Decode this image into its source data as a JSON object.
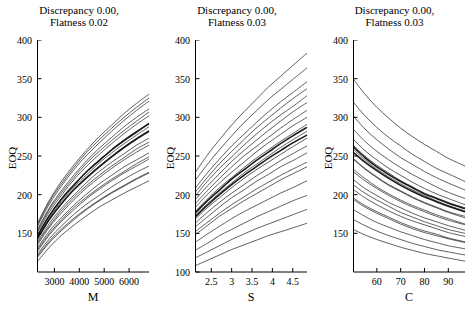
{
  "chart_data": [
    {
      "type": "line",
      "title": "Discrepancy 0.00, Flatness 0.02",
      "title_lines": [
        "Discrepancy 0.00,",
        "Flatness 0.02"
      ],
      "xlabel": "M",
      "ylabel": "EOQ",
      "xlim": [
        2300,
        6800
      ],
      "ylim": [
        100,
        400
      ],
      "xticks": [
        3000,
        4000,
        5000,
        6000
      ],
      "yticks": [
        150,
        200,
        250,
        300,
        350,
        400
      ],
      "grid": false,
      "legend": "none",
      "x": [
        2300,
        2800,
        3300,
        3800,
        4300,
        4800,
        5300,
        5800,
        6300,
        6800
      ],
      "series": [
        {
          "name": "curve-01",
          "values": [
            113,
            132,
            148,
            161,
            173,
            184,
            193,
            202,
            210,
            218
          ]
        },
        {
          "name": "curve-02",
          "values": [
            118,
            138,
            154,
            168,
            181,
            192,
            202,
            211,
            220,
            228
          ]
        },
        {
          "name": "curve-03",
          "values": [
            122,
            143,
            160,
            175,
            188,
            199,
            210,
            220,
            229,
            237
          ]
        },
        {
          "name": "curve-04",
          "values": [
            126,
            148,
            166,
            181,
            195,
            207,
            218,
            228,
            237,
            246
          ]
        },
        {
          "name": "curve-05",
          "values": [
            130,
            153,
            171,
            187,
            201,
            214,
            225,
            236,
            245,
            254
          ]
        },
        {
          "name": "curve-06",
          "values": [
            134,
            158,
            177,
            194,
            209,
            222,
            234,
            245,
            255,
            264
          ]
        },
        {
          "name": "curve-07",
          "values": [
            138,
            163,
            183,
            200,
            216,
            230,
            242,
            253,
            264,
            273
          ]
        },
        {
          "name": "curve-08",
          "values": [
            142,
            168,
            189,
            207,
            223,
            237,
            250,
            262,
            273,
            283
          ]
        },
        {
          "name": "curve-09",
          "values": [
            146,
            173,
            195,
            213,
            230,
            245,
            258,
            271,
            282,
            292
          ]
        },
        {
          "name": "curve-10",
          "values": [
            150,
            178,
            200,
            220,
            237,
            252,
            266,
            279,
            291,
            302
          ]
        },
        {
          "name": "curve-11",
          "values": [
            154,
            183,
            206,
            226,
            244,
            260,
            274,
            288,
            300,
            311
          ]
        },
        {
          "name": "curve-12",
          "values": [
            158,
            188,
            212,
            233,
            251,
            267,
            282,
            296,
            309,
            321
          ]
        },
        {
          "name": "curve-13",
          "values": [
            162,
            193,
            218,
            239,
            258,
            275,
            290,
            305,
            318,
            330
          ]
        },
        {
          "name": "curve-14",
          "values": [
            120,
            140,
            156,
            170,
            182,
            193,
            203,
            212,
            221,
            229
          ]
        },
        {
          "name": "curve-15",
          "values": [
            128,
            150,
            168,
            184,
            197,
            209,
            220,
            230,
            240,
            249
          ]
        },
        {
          "name": "curve-16",
          "values": [
            136,
            160,
            180,
            197,
            212,
            225,
            237,
            248,
            259,
            268
          ]
        },
        {
          "name": "curve-17",
          "values": [
            144,
            170,
            192,
            210,
            226,
            241,
            254,
            266,
            277,
            288
          ]
        },
        {
          "name": "curve-18",
          "values": [
            152,
            181,
            203,
            223,
            241,
            256,
            270,
            283,
            295,
            307
          ]
        },
        {
          "name": "curve-19",
          "values": [
            160,
            191,
            215,
            236,
            255,
            271,
            286,
            300,
            313,
            325
          ]
        },
        {
          "name": "curve-bold-1",
          "values": [
            146,
            173,
            195,
            213,
            230,
            244,
            258,
            270,
            281,
            292
          ]
        },
        {
          "name": "curve-bold-2",
          "values": [
            142,
            168,
            189,
            207,
            222,
            236,
            249,
            261,
            272,
            282
          ]
        }
      ]
    },
    {
      "type": "line",
      "title": "Discrepancy 0.00, Flatness 0.03",
      "title_lines": [
        "Discrepancy 0.00,",
        "Flatness 0.03"
      ],
      "xlabel": "S",
      "ylabel": "EOQ",
      "xlim": [
        2.1,
        4.85
      ],
      "ylim": [
        100,
        400
      ],
      "xticks": [
        2.5,
        3,
        3.5,
        4,
        4.5
      ],
      "yticks": [
        100,
        150,
        200,
        250,
        300,
        350,
        400
      ],
      "grid": false,
      "legend": "none",
      "x": [
        2.1,
        2.4,
        2.7,
        3.0,
        3.3,
        3.6,
        3.9,
        4.2,
        4.5,
        4.85
      ],
      "series": [
        {
          "name": "curve-01",
          "values": [
            108,
            115,
            122,
            129,
            135,
            141,
            147,
            152,
            157,
            163
          ]
        },
        {
          "name": "curve-02",
          "values": [
            118,
            126,
            134,
            142,
            149,
            156,
            162,
            168,
            174,
            181
          ]
        },
        {
          "name": "curve-03",
          "values": [
            128,
            137,
            147,
            155,
            163,
            171,
            178,
            185,
            192,
            199
          ]
        },
        {
          "name": "curve-04",
          "values": [
            138,
            149,
            159,
            169,
            178,
            186,
            194,
            202,
            209,
            218
          ]
        },
        {
          "name": "curve-05",
          "values": [
            148,
            160,
            172,
            182,
            192,
            201,
            210,
            219,
            227,
            236
          ]
        },
        {
          "name": "curve-06",
          "values": [
            158,
            171,
            184,
            196,
            206,
            217,
            226,
            236,
            244,
            254
          ]
        },
        {
          "name": "curve-07",
          "values": [
            168,
            183,
            196,
            209,
            221,
            232,
            242,
            252,
            262,
            273
          ]
        },
        {
          "name": "curve-08",
          "values": [
            178,
            194,
            209,
            222,
            235,
            247,
            258,
            269,
            279,
            291
          ]
        },
        {
          "name": "curve-09",
          "values": [
            188,
            205,
            221,
            236,
            250,
            262,
            274,
            286,
            297,
            309
          ]
        },
        {
          "name": "curve-10",
          "values": [
            198,
            217,
            234,
            249,
            264,
            278,
            291,
            303,
            314,
            328
          ]
        },
        {
          "name": "curve-11",
          "values": [
            208,
            228,
            246,
            263,
            278,
            293,
            307,
            320,
            332,
            346
          ]
        },
        {
          "name": "curve-12",
          "values": [
            218,
            239,
            258,
            276,
            293,
            308,
            323,
            336,
            349,
            364
          ]
        },
        {
          "name": "curve-13",
          "values": [
            228,
            251,
            271,
            290,
            307,
            323,
            339,
            353,
            367,
            383
          ]
        },
        {
          "name": "curve-14",
          "values": [
            152,
            164,
            176,
            187,
            197,
            207,
            216,
            225,
            233,
            242
          ]
        },
        {
          "name": "curve-15",
          "values": [
            163,
            177,
            190,
            202,
            213,
            224,
            234,
            244,
            253,
            263
          ]
        },
        {
          "name": "curve-16",
          "values": [
            173,
            188,
            202,
            215,
            228,
            239,
            250,
            261,
            271,
            282
          ]
        },
        {
          "name": "curve-17",
          "values": [
            183,
            200,
            215,
            229,
            242,
            255,
            267,
            278,
            289,
            300
          ]
        },
        {
          "name": "curve-18",
          "values": [
            193,
            211,
            227,
            243,
            257,
            270,
            283,
            295,
            307,
            319
          ]
        },
        {
          "name": "curve-19",
          "values": [
            203,
            222,
            240,
            256,
            271,
            286,
            299,
            312,
            324,
            337
          ]
        },
        {
          "name": "curve-bold-1",
          "values": [
            176,
            192,
            206,
            220,
            232,
            244,
            255,
            266,
            276,
            287
          ]
        },
        {
          "name": "curve-bold-2",
          "values": [
            171,
            186,
            200,
            213,
            225,
            236,
            247,
            257,
            267,
            277
          ]
        }
      ]
    },
    {
      "type": "line",
      "title": "Discrepancy 0.00, Flatness 0.03",
      "title_lines": [
        "Discrepancy 0.00,",
        "Flatness 0.03"
      ],
      "xlabel": "C",
      "ylabel": "EOQ",
      "xlim": [
        50,
        97
      ],
      "ylim": [
        100,
        400
      ],
      "xticks": [
        60,
        70,
        80,
        90
      ],
      "yticks": [
        150,
        200,
        250,
        300,
        350,
        400
      ],
      "grid": false,
      "legend": "none",
      "x": [
        50,
        55,
        60,
        65,
        70,
        75,
        80,
        85,
        90,
        97
      ],
      "series": [
        {
          "name": "curve-01",
          "values": [
            155,
            148,
            142,
            137,
            132,
            128,
            124,
            121,
            118,
            114
          ]
        },
        {
          "name": "curve-02",
          "values": [
            168,
            160,
            153,
            147,
            142,
            137,
            133,
            129,
            126,
            122
          ]
        },
        {
          "name": "curve-03",
          "values": [
            181,
            172,
            164,
            158,
            152,
            147,
            142,
            138,
            134,
            130
          ]
        },
        {
          "name": "curve-04",
          "values": [
            194,
            184,
            176,
            169,
            162,
            156,
            151,
            147,
            143,
            138
          ]
        },
        {
          "name": "curve-05",
          "values": [
            207,
            196,
            187,
            179,
            172,
            166,
            161,
            156,
            151,
            146
          ]
        },
        {
          "name": "curve-06",
          "values": [
            220,
            208,
            199,
            190,
            183,
            176,
            170,
            165,
            160,
            154
          ]
        },
        {
          "name": "curve-07",
          "values": [
            233,
            221,
            210,
            201,
            193,
            186,
            180,
            174,
            169,
            162
          ]
        },
        {
          "name": "curve-08",
          "values": [
            246,
            233,
            222,
            212,
            204,
            196,
            189,
            183,
            177,
            170
          ]
        },
        {
          "name": "curve-09",
          "values": [
            259,
            245,
            233,
            223,
            214,
            206,
            199,
            192,
            186,
            179
          ]
        },
        {
          "name": "curve-10",
          "values": [
            272,
            257,
            245,
            234,
            225,
            216,
            208,
            201,
            195,
            187
          ]
        },
        {
          "name": "curve-11",
          "values": [
            285,
            269,
            256,
            245,
            235,
            226,
            218,
            210,
            203,
            195
          ]
        },
        {
          "name": "curve-12",
          "values": [
            302,
            285,
            271,
            259,
            248,
            239,
            230,
            222,
            215,
            206
          ]
        },
        {
          "name": "curve-13",
          "values": [
            320,
            302,
            287,
            274,
            263,
            252,
            243,
            234,
            227,
            217
          ]
        },
        {
          "name": "curve-14",
          "values": [
            350,
            330,
            313,
            299,
            286,
            275,
            265,
            256,
            247,
            237
          ]
        },
        {
          "name": "curve-15",
          "values": [
            196,
            186,
            178,
            171,
            164,
            158,
            153,
            149,
            144,
            139
          ]
        },
        {
          "name": "curve-16",
          "values": [
            213,
            202,
            193,
            185,
            177,
            171,
            165,
            160,
            155,
            150
          ]
        },
        {
          "name": "curve-17",
          "values": [
            230,
            218,
            208,
            199,
            191,
            184,
            178,
            172,
            167,
            161
          ]
        },
        {
          "name": "curve-18",
          "values": [
            247,
            234,
            223,
            213,
            205,
            197,
            190,
            184,
            178,
            172
          ]
        },
        {
          "name": "curve-19",
          "values": [
            264,
            250,
            238,
            228,
            218,
            210,
            202,
            196,
            190,
            183
          ]
        },
        {
          "name": "curve-bold-1",
          "values": [
            262,
            248,
            236,
            226,
            217,
            209,
            201,
            195,
            189,
            182
          ]
        },
        {
          "name": "curve-bold-2",
          "values": [
            255,
            242,
            231,
            221,
            212,
            204,
            197,
            191,
            185,
            178
          ]
        }
      ]
    }
  ],
  "panels": [
    {
      "title_line1": "Discrepancy 0.00,",
      "title_line2": "Flatness 0.02",
      "xlabel": "M",
      "ylabel": "EOQ",
      "yticks": [
        "400",
        "350",
        "300",
        "250",
        "200",
        "150"
      ],
      "xticks": [
        "3000",
        "4000",
        "5000",
        "6000"
      ]
    },
    {
      "title_line1": "Discrepancy 0.00,",
      "title_line2": "Flatness 0.03",
      "xlabel": "S",
      "ylabel": "EOQ",
      "yticks": [
        "400",
        "350",
        "300",
        "250",
        "200",
        "150",
        "100"
      ],
      "xticks": [
        "2.5",
        "3",
        "3.5",
        "4",
        "4.5"
      ]
    },
    {
      "title_line1": "Discrepancy 0.00,",
      "title_line2": "Flatness 0.03",
      "xlabel": "C",
      "ylabel": "EOQ",
      "yticks": [
        "400",
        "350",
        "300",
        "250",
        "200",
        "150"
      ],
      "xticks": [
        "60",
        "70",
        "80",
        "90"
      ]
    }
  ],
  "style": {
    "line_color": "#1a1a1a",
    "axis_color": "#000000",
    "background": "#ffffff"
  }
}
